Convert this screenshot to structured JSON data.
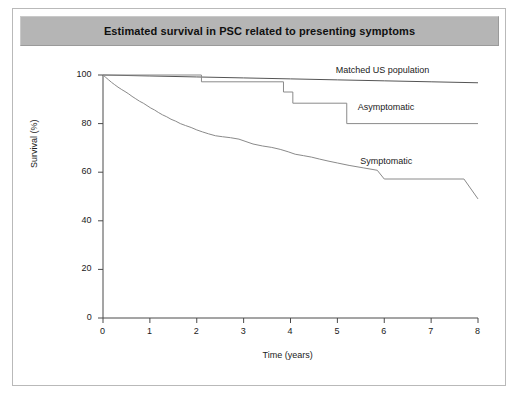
{
  "figure": {
    "title": "Estimated survival in PSC related to presenting symptoms"
  },
  "chart_data": {
    "type": "line",
    "title": "Estimated survival in PSC related to presenting symptoms",
    "xlabel": "Time (years)",
    "ylabel": "Survival (%)",
    "xlim": [
      0,
      8
    ],
    "ylim": [
      0,
      100
    ],
    "xticks": [
      0,
      1,
      2,
      3,
      4,
      5,
      6,
      7,
      8
    ],
    "yticks": [
      0,
      20,
      40,
      60,
      80,
      100
    ],
    "xtick_labels": [
      "0",
      "1",
      "2",
      "3",
      "4",
      "5",
      "6",
      "7",
      "8"
    ],
    "ytick_labels": [
      "0",
      "20",
      "40",
      "60",
      "80",
      "100"
    ],
    "grid": false,
    "legend_position": "inline-right-annotations",
    "step_style": "post",
    "series": [
      {
        "name": "Matched US population",
        "label_x": 5.85,
        "label_y": 101.5,
        "color": "#555555",
        "x": [
          0,
          1,
          2,
          3,
          4,
          5,
          6,
          7,
          8
        ],
        "y": [
          100,
          99.6,
          99.2,
          98.8,
          98.4,
          98.0,
          97.6,
          97.2,
          96.8
        ]
      },
      {
        "name": "Asymptomatic",
        "label_x": 5.85,
        "label_y": 86.5,
        "color": "#8a8a8a",
        "x": [
          0,
          2.1,
          2.1,
          3.85,
          3.85,
          4.05,
          4.05,
          5.2,
          5.2,
          8.0
        ],
        "y": [
          100,
          100,
          97.2,
          97.2,
          93.0,
          93.0,
          88.4,
          88.4,
          80.0,
          80.0
        ]
      },
      {
        "name": "Symptomatic",
        "label_x": 5.85,
        "label_y": 64.0,
        "color": "#8a8a8a",
        "x": [
          0,
          0.06,
          0.12,
          0.18,
          0.25,
          0.32,
          0.4,
          0.47,
          0.55,
          0.62,
          0.7,
          0.78,
          0.86,
          0.94,
          1.02,
          1.1,
          1.18,
          1.27,
          1.36,
          1.45,
          1.55,
          1.65,
          1.76,
          1.88,
          2.0,
          2.12,
          2.25,
          2.4,
          2.55,
          2.72,
          2.9,
          3.05,
          3.2,
          3.4,
          3.6,
          3.78,
          3.95,
          4.1,
          4.28,
          4.45,
          4.62,
          4.8,
          5.0,
          5.25,
          5.55,
          5.85,
          6.0,
          7.7,
          8.0
        ],
        "y": [
          100,
          99.0,
          98.0,
          97.0,
          96.0,
          95.0,
          94.0,
          93.2,
          92.2,
          91.2,
          90.2,
          89.2,
          88.4,
          87.4,
          86.4,
          85.6,
          84.6,
          83.6,
          82.8,
          81.8,
          81.0,
          80.0,
          79.2,
          78.4,
          77.4,
          76.6,
          75.8,
          75.0,
          74.6,
          74.2,
          73.6,
          72.6,
          71.6,
          70.8,
          70.2,
          69.4,
          68.4,
          67.4,
          66.8,
          66.2,
          65.4,
          64.6,
          63.8,
          62.8,
          61.8,
          60.8,
          57.2,
          57.2,
          49.0
        ]
      }
    ]
  }
}
